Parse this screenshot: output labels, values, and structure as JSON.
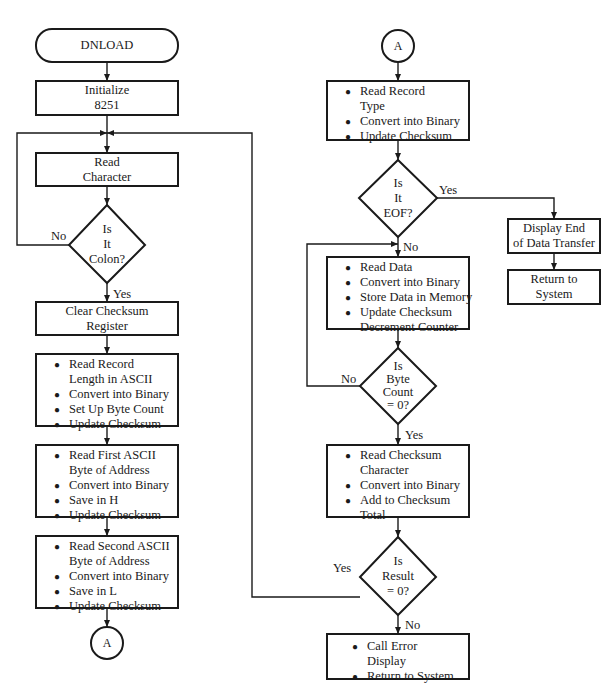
{
  "diagram": {
    "type": "flowchart",
    "left_column": {
      "start": "DNLOAD",
      "initialize": [
        "Initialize",
        "8251"
      ],
      "read_character": [
        "Read",
        "Character"
      ],
      "decision_colon": [
        "Is",
        "It",
        "Colon?"
      ],
      "decision_colon_no": "No",
      "decision_colon_yes": "Yes",
      "clear_checksum": [
        "Clear Checksum",
        "Register"
      ],
      "record_length": {
        "items": [
          {
            "bullet": true,
            "text": "Read Record"
          },
          {
            "bullet": false,
            "text": "Length in ASCII"
          },
          {
            "bullet": true,
            "text": "Convert into Binary"
          },
          {
            "bullet": true,
            "text": "Set Up Byte Count"
          },
          {
            "bullet": true,
            "text": "Update Checksum"
          }
        ]
      },
      "first_address": {
        "items": [
          {
            "bullet": true,
            "text": "Read First ASCII"
          },
          {
            "bullet": false,
            "text": "Byte of Address"
          },
          {
            "bullet": true,
            "text": "Convert into Binary"
          },
          {
            "bullet": true,
            "text": "Save in H"
          },
          {
            "bullet": true,
            "text": "Update Checksum"
          }
        ]
      },
      "second_address": {
        "items": [
          {
            "bullet": true,
            "text": "Read Second ASCII"
          },
          {
            "bullet": false,
            "text": "Byte of Address"
          },
          {
            "bullet": true,
            "text": "Convert into Binary"
          },
          {
            "bullet": true,
            "text": "Save in L"
          },
          {
            "bullet": true,
            "text": "Update Checksum"
          }
        ]
      },
      "connector_out": "A"
    },
    "right_column": {
      "connector_in": "A",
      "record_type": {
        "items": [
          {
            "bullet": true,
            "text": "Read Record"
          },
          {
            "bullet": false,
            "text": "Type"
          },
          {
            "bullet": true,
            "text": "Convert into Binary"
          },
          {
            "bullet": true,
            "text": "Update Checksum"
          }
        ]
      },
      "decision_eof": [
        "Is",
        "It",
        "EOF?"
      ],
      "decision_eof_yes": "Yes",
      "decision_eof_no": "No",
      "display_end": [
        "Display End",
        "of Data Transfer"
      ],
      "return_system_1": [
        "Return to",
        "System"
      ],
      "read_data": {
        "items": [
          {
            "bullet": true,
            "text": "Read Data"
          },
          {
            "bullet": true,
            "text": "Convert into Binary"
          },
          {
            "bullet": true,
            "text": "Store Data in Memory"
          },
          {
            "bullet": true,
            "text": "Update Checksum"
          },
          {
            "bullet": false,
            "text": "Decrement Counter"
          }
        ]
      },
      "decision_byte_count": [
        "Is",
        "Byte",
        "Count",
        "= 0?"
      ],
      "decision_byte_count_no": "No",
      "decision_byte_count_yes": "Yes",
      "read_checksum": {
        "items": [
          {
            "bullet": true,
            "text": "Read Checksum"
          },
          {
            "bullet": false,
            "text": "Character"
          },
          {
            "bullet": true,
            "text": "Convert into Binary"
          },
          {
            "bullet": true,
            "text": "Add to Checksum"
          },
          {
            "bullet": false,
            "text": "Total"
          }
        ]
      },
      "decision_result": [
        "Is",
        "Result",
        "= 0?"
      ],
      "decision_result_yes": "Yes",
      "decision_result_no": "No",
      "error_box": {
        "items": [
          {
            "bullet": true,
            "text": "Call Error"
          },
          {
            "bullet": false,
            "text": "Display"
          },
          {
            "bullet": true,
            "text": "Return to System"
          }
        ]
      }
    }
  }
}
